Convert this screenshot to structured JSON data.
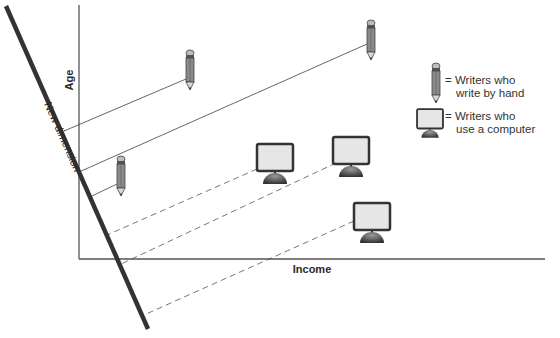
{
  "diagram": {
    "axes": {
      "y_label": "Age",
      "x_label": "Income",
      "new_dimension_label": "New dimension"
    },
    "legend": [
      {
        "icon": "pencil-icon",
        "line1": "= Writers who",
        "line2": "write by hand"
      },
      {
        "icon": "computer-icon",
        "line1": "= Writers who",
        "line2": "use a computer"
      }
    ],
    "points": {
      "hand_writers": [
        {
          "x": 190,
          "y": 75
        },
        {
          "x": 371,
          "y": 45
        },
        {
          "x": 121,
          "y": 180
        }
      ],
      "computer_users": [
        {
          "x": 275,
          "y": 165
        },
        {
          "x": 350,
          "y": 157
        },
        {
          "x": 371,
          "y": 222
        }
      ]
    },
    "colors": {
      "axis": "#555555",
      "new_dimension": "#333333",
      "projection": "#666666",
      "icon_fill": "#e4e4e4",
      "icon_dark": "#444444"
    }
  }
}
